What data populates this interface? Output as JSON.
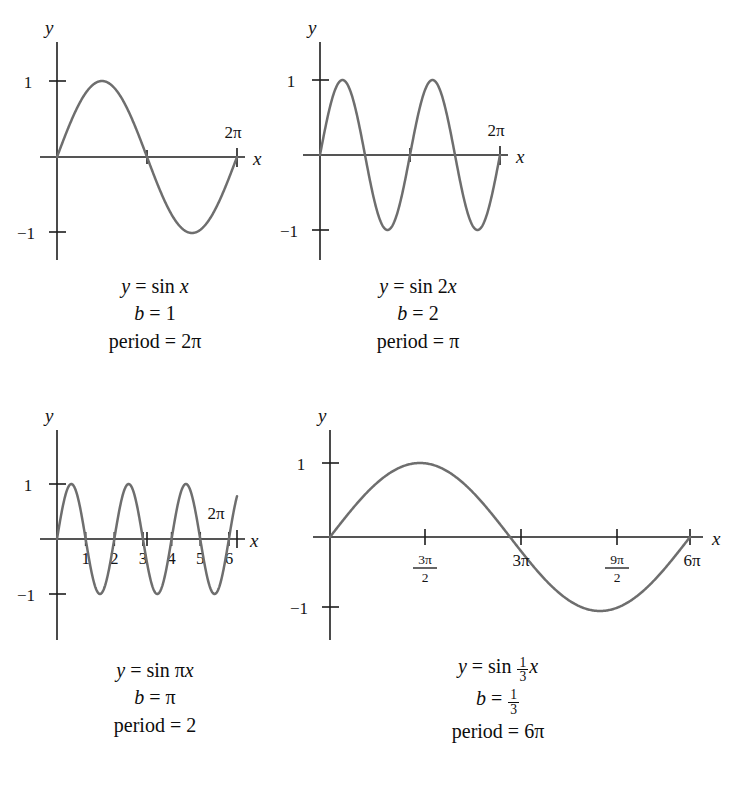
{
  "page": {
    "background": "#ffffff",
    "curve_color": "#6e6e6e",
    "axis_color": "#1d1d1d",
    "text_color": "#0d0d0d",
    "width": 750,
    "height": 812
  },
  "chart_data": [
    {
      "id": "panel-1",
      "type": "line",
      "title": "",
      "function": "y = sin x",
      "b": "1",
      "period": "2π",
      "b_value": 1,
      "xlabel": "x",
      "ylabel": "y",
      "xlim": [
        0,
        6.283185
      ],
      "ylim": [
        -1,
        1
      ],
      "grid": false,
      "legend": "none",
      "y_ticks": [
        {
          "value": 1,
          "label": "1"
        },
        {
          "value": -1,
          "label": "−1"
        }
      ],
      "x_ticks": [
        {
          "value": 3.141593,
          "label": ""
        },
        {
          "value": 6.283185,
          "label": "2π"
        }
      ],
      "x_axis_end_label": "2π",
      "description": "One full sine cycle from 0 to 2π"
    },
    {
      "id": "panel-2",
      "type": "line",
      "title": "",
      "function": "y = sin 2x",
      "b": "2",
      "period": "π",
      "b_value": 2,
      "xlabel": "x",
      "ylabel": "y",
      "xlim": [
        0,
        6.283185
      ],
      "ylim": [
        -1,
        1
      ],
      "grid": false,
      "legend": "none",
      "y_ticks": [
        {
          "value": 1,
          "label": "1"
        },
        {
          "value": -1,
          "label": "−1"
        }
      ],
      "x_ticks": [
        {
          "value": 3.141593,
          "label": ""
        },
        {
          "value": 6.283185,
          "label": "2π"
        }
      ],
      "x_axis_end_label": "2π",
      "description": "Two full sine cycles from 0 to 2π"
    },
    {
      "id": "panel-3",
      "type": "line",
      "title": "",
      "function": "y = sin πx",
      "b": "π",
      "period": "2",
      "b_value": 3.141593,
      "xlabel": "x",
      "ylabel": "y",
      "xlim": [
        0,
        6.283185
      ],
      "ylim": [
        -1,
        1
      ],
      "grid": false,
      "legend": "none",
      "y_ticks": [
        {
          "value": 1,
          "label": "1"
        },
        {
          "value": -1,
          "label": "−1"
        }
      ],
      "x_ticks": [
        {
          "value": 1,
          "label": "1"
        },
        {
          "value": 2,
          "label": "2"
        },
        {
          "value": 3,
          "label": "3"
        },
        {
          "value": 3.141593,
          "label": ""
        },
        {
          "value": 4,
          "label": "4"
        },
        {
          "value": 5,
          "label": "5"
        },
        {
          "value": 6,
          "label": "6"
        },
        {
          "value": 6.283185,
          "label": ""
        }
      ],
      "x_axis_end_label": "2π",
      "description": "Sine with period 2; slightly more than three cycles shown to 2π"
    },
    {
      "id": "panel-4",
      "type": "line",
      "title": "",
      "function_parts": {
        "lead": "y = sin ",
        "frac_num": "1",
        "frac_den": "3",
        "tail": "x"
      },
      "function": "y = sin 1/3 x",
      "b_parts": {
        "lead": "b = ",
        "frac_num": "1",
        "frac_den": "3"
      },
      "b": "1/3",
      "period": "6π",
      "b_value": 0.333333,
      "xlabel": "x",
      "ylabel": "y",
      "xlim": [
        0,
        18.849556
      ],
      "ylim": [
        -1,
        1
      ],
      "grid": false,
      "legend": "none",
      "y_ticks": [
        {
          "value": 1,
          "label": "1"
        },
        {
          "value": -1,
          "label": "−1"
        }
      ],
      "x_ticks": [
        {
          "value": 4.712389,
          "label": "3π/2",
          "num": "3π",
          "den": "2"
        },
        {
          "value": 9.424778,
          "label": "3π"
        },
        {
          "value": 14.137167,
          "label": "9π/2",
          "num": "9π",
          "den": "2"
        },
        {
          "value": 18.849556,
          "label": "6π"
        }
      ],
      "x_axis_end_label": "6π",
      "description": "One full sine cycle stretched over 0 to 6π"
    }
  ],
  "captions": {
    "panel_1": {
      "line1": "y = sin x",
      "line2": "b = 1",
      "line3": "period = 2π"
    },
    "panel_2": {
      "line1": "y = sin 2x",
      "line2": "b = 2",
      "line3": "period = π"
    },
    "panel_3": {
      "line1": "y = sin πx",
      "line2": "b = π",
      "line3": "period = 2"
    },
    "panel_4": {
      "line3": "period = 6π"
    }
  },
  "labels": {
    "y_axis": "y",
    "x_axis": "x",
    "one": "1",
    "minus_one": "−1",
    "two_pi": "2π",
    "six_pi": "6π",
    "three_pi": "3π",
    "period_word": "period",
    "equals": "=",
    "b_symbol": "b",
    "sin_word": "sin",
    "pi": "π",
    "tick_1": "1",
    "tick_2": "2",
    "tick_3": "3",
    "tick_4": "4",
    "tick_5": "5",
    "tick_6": "6",
    "frac_3pi_num": "3π",
    "frac_3pi_den": "2",
    "frac_9pi_num": "9π",
    "frac_9pi_den": "2",
    "frac_one": "1",
    "frac_three": "3"
  }
}
